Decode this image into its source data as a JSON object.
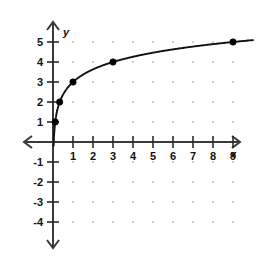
{
  "chart_data": {
    "type": "line",
    "title": "",
    "xlabel": "x",
    "ylabel": "y",
    "xlim": [
      -1,
      10
    ],
    "ylim": [
      -4.6,
      5.8
    ],
    "grid": true,
    "grid_style": "dots at integer lattice points",
    "legend": "none",
    "function": "y = log base 3 of x, plus 3",
    "x_ticks": [
      1,
      2,
      3,
      4,
      5,
      6,
      7,
      8,
      9
    ],
    "x_tick_labels": [
      "1",
      "2",
      "3",
      "4",
      "5",
      "6",
      "7",
      "8",
      "9"
    ],
    "y_ticks": [
      5,
      4,
      3,
      2,
      1,
      -1,
      -2,
      -3,
      -4
    ],
    "y_tick_labels": [
      "5",
      "4",
      "3",
      "2",
      "1",
      "-1",
      "-2",
      "-3",
      "-4"
    ],
    "series": [
      {
        "name": "logarithmic curve",
        "marked_points": [
          {
            "x": 0.111,
            "y": 1,
            "label": "(1/9, 1)"
          },
          {
            "x": 0.333,
            "y": 2,
            "label": "(1/3, 2)"
          },
          {
            "x": 1,
            "y": 3,
            "label": "(1, 3)"
          },
          {
            "x": 3,
            "y": 4,
            "label": "(3, 4)"
          },
          {
            "x": 9,
            "y": 5,
            "label": "(9, 5)"
          }
        ]
      }
    ],
    "axes": {
      "x_axis_label": "x",
      "y_axis_label": "y",
      "x_arrows": "both",
      "y_arrows": "both",
      "origin_label": ""
    },
    "colors": {
      "curve": "#111111",
      "point": "#000000",
      "axis": "#3a3a3a",
      "grid_dot": "#b9b9b9",
      "background": "#ffffff",
      "text": "#111111"
    }
  },
  "axis_labels": {
    "x": "x",
    "y": "y"
  }
}
